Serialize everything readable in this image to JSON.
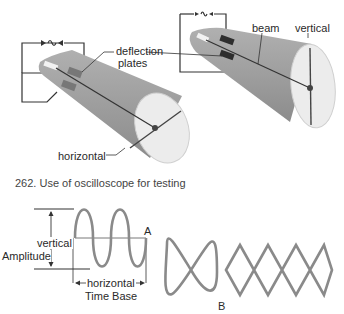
{
  "figure": {
    "caption": "262. Use of oscilloscope for testing"
  },
  "top_left_tube": {
    "labels": {
      "deflection": "deflection",
      "plates": "plates",
      "horizontal": "horizontal"
    },
    "trace_orientation": "horizontal"
  },
  "top_right_tube": {
    "labels": {
      "beam": "beam",
      "vertical": "vertical"
    },
    "trace_orientation": "vertical"
  },
  "waveform_a": {
    "id_label": "A",
    "amplitude_labels": {
      "vertical": "vertical",
      "amplitude": "Amplitude"
    },
    "time_labels": {
      "horizontal": "horizontal",
      "time_base": "Time Base"
    },
    "cycles": 2
  },
  "lissajous_b": {
    "id_label": "B",
    "figures": [
      {
        "type": "figure-eight",
        "loops": 2
      },
      {
        "type": "chain",
        "loops": 5
      }
    ]
  },
  "colors": {
    "tube_body": "#9a9a9a",
    "screen": "#ececec",
    "wave_stroke": "#8a8a8a",
    "line": "#333333"
  }
}
